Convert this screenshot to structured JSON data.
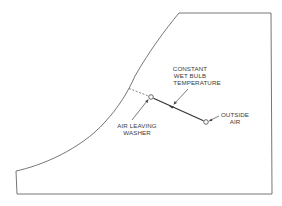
{
  "diagram": {
    "type": "psychrometric-chart-sketch",
    "labels": {
      "constant_wet_bulb": [
        "CONSTANT",
        "WET BULB",
        "TEMPERATURE"
      ],
      "air_leaving_washer": [
        "AIR LEAVING",
        "WASHER"
      ],
      "outside_air": [
        "OUTSIDE",
        "AIR"
      ]
    },
    "points": {
      "air_leaving_washer": {
        "x": 151,
        "y": 97
      },
      "outside_air": {
        "x": 206,
        "y": 122
      },
      "saturation_intersect": {
        "x": 128,
        "y": 88
      }
    },
    "colors": {
      "line": "#555555",
      "text": "#3a3a3a",
      "background": "#ffffff"
    }
  }
}
